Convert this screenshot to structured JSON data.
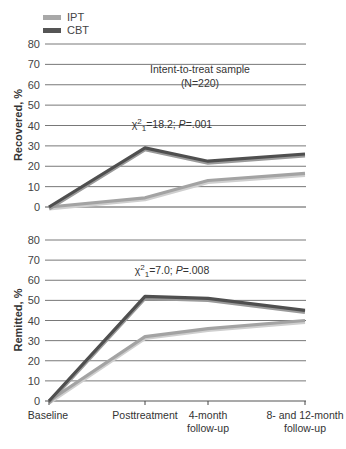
{
  "legend": [
    {
      "name": "IPT",
      "color": "#a8a8a8"
    },
    {
      "name": "CBT",
      "color": "#555555"
    }
  ],
  "annotation": {
    "line1": "Intent-to-treat sample",
    "line2": "(N=220)"
  },
  "x_labels": [
    [
      "Baseline"
    ],
    [
      "Posttreatment"
    ],
    [
      "4-month",
      "follow-up"
    ],
    [
      "8- and 12-month",
      "follow-up"
    ]
  ],
  "chart_data": [
    {
      "type": "line",
      "title": "Intent-to-treat sample (N=220)",
      "ylabel": "Recovered, %",
      "xlabel": "",
      "ylim": [
        0,
        80
      ],
      "yticks": [
        0,
        10,
        20,
        30,
        40,
        50,
        60,
        70,
        80
      ],
      "grid": true,
      "legend_position": "top-left",
      "categories": [
        "Baseline",
        "Posttreatment",
        "4-month follow-up",
        "8- and 12-month follow-up"
      ],
      "annotation": "χ²₁=18.2; P=.001",
      "stat": {
        "chi_sq_label": "χ",
        "sup": "2",
        "sub": "1",
        "value": "=18.2; ",
        "p_label": "P",
        "p_value": "=.001"
      },
      "series": [
        {
          "name": "IPT",
          "values": [
            0,
            4.5,
            13,
            16.5
          ]
        },
        {
          "name": "CBT",
          "values": [
            0,
            29,
            22.5,
            26
          ]
        }
      ]
    },
    {
      "type": "line",
      "ylabel": "Remitted, %",
      "xlabel": "",
      "ylim": [
        0,
        80
      ],
      "yticks": [
        0,
        10,
        20,
        30,
        40,
        50,
        60,
        70,
        80
      ],
      "grid": true,
      "categories": [
        "Baseline",
        "Posttreatment",
        "4-month follow-up",
        "8- and 12-month follow-up"
      ],
      "annotation": "χ²₁=7.0; P=.008",
      "stat": {
        "chi_sq_label": "χ",
        "sup": "2",
        "sub": "1",
        "value": "=7.0; ",
        "p_label": "P",
        "p_value": "=.008"
      },
      "series": [
        {
          "name": "IPT",
          "values": [
            0,
            32,
            36,
            40
          ]
        },
        {
          "name": "CBT",
          "values": [
            0,
            52,
            51,
            45
          ]
        }
      ]
    }
  ]
}
